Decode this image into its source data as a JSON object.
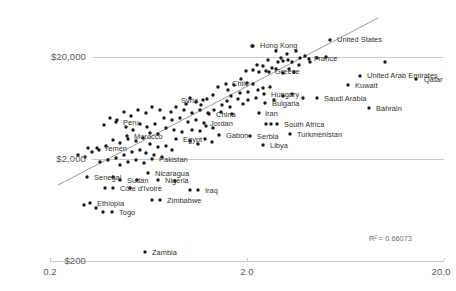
{
  "chart_data": {
    "type": "scatter",
    "title": "",
    "xlabel": "",
    "ylabel": "",
    "xscale": "log",
    "yscale": "log",
    "xlim": [
      0.2,
      20.0
    ],
    "ylim": [
      200,
      20000
    ],
    "x_ticks": [
      "0.2",
      "2.0",
      "20.0"
    ],
    "x_tick_values": [
      0.2,
      2.0,
      20.0
    ],
    "y_ticks": [
      "$200",
      "$2,000",
      "$20,000"
    ],
    "y_tick_values": [
      200,
      2000,
      20000
    ],
    "grid": true,
    "legend": null,
    "annotation": "R² = 0.66073",
    "annotation_r2": 0.66073,
    "trendline": {
      "x0": 0.28,
      "y0": 260,
      "x1": 13.5,
      "y1": 33000
    },
    "dot_color": "#1a1a1a",
    "line_color": "#9a9a9a",
    "axis_color": "#c9c9c9",
    "points": [
      {
        "label": "Hong Kong",
        "px": 253,
        "py": 46,
        "lx": 260,
        "ly": 42
      },
      {
        "label": "United States",
        "px": 330,
        "py": 40,
        "lx": 337,
        "ly": 36
      },
      {
        "label": "France",
        "px": 309,
        "py": 59,
        "lx": 314,
        "ly": 55
      },
      {
        "label": "Greece",
        "px": 269,
        "py": 72,
        "lx": 275,
        "ly": 68
      },
      {
        "label": "United Arab Emirates",
        "px": 360,
        "py": 76,
        "lx": 367,
        "ly": 72
      },
      {
        "label": "Qatar",
        "px": 416,
        "py": 79,
        "lx": 424,
        "ly": 76
      },
      {
        "label": "Kuwait",
        "px": 348,
        "py": 85,
        "lx": 355,
        "ly": 82
      },
      {
        "label": "Chile",
        "px": 226,
        "py": 84,
        "lx": 232,
        "ly": 80
      },
      {
        "label": "Hungary",
        "px": 264,
        "py": 94,
        "lx": 271,
        "ly": 91
      },
      {
        "label": "Saudi Arabia",
        "px": 317,
        "py": 98,
        "lx": 324,
        "ly": 95
      },
      {
        "label": "Bahrain",
        "px": 369,
        "py": 108,
        "lx": 376,
        "ly": 105
      },
      {
        "label": "Bulgaria",
        "px": 265,
        "py": 103,
        "lx": 272,
        "ly": 100
      },
      {
        "label": "Syria",
        "px": 203,
        "py": 100,
        "lx": 181,
        "ly": 97
      },
      {
        "label": "Iran",
        "px": 259,
        "py": 113,
        "lx": 265,
        "ly": 110
      },
      {
        "label": "China",
        "px": 209,
        "py": 114,
        "lx": 216,
        "ly": 111
      },
      {
        "label": "Jordan",
        "px": 204,
        "py": 123,
        "lx": 210,
        "ly": 120
      },
      {
        "label": "South Africa",
        "px": 277,
        "py": 124,
        "lx": 284,
        "ly": 121
      },
      {
        "label": "Turkmenistan",
        "px": 290,
        "py": 134,
        "lx": 297,
        "ly": 131
      },
      {
        "label": "Serbia",
        "px": 250,
        "py": 136,
        "lx": 257,
        "ly": 133
      },
      {
        "label": "Gabon",
        "px": 219,
        "py": 135,
        "lx": 226,
        "ly": 132
      },
      {
        "label": "Libya",
        "px": 263,
        "py": 145,
        "lx": 270,
        "ly": 142
      },
      {
        "label": "Peru",
        "px": 116,
        "py": 122,
        "lx": 123,
        "ly": 119
      },
      {
        "label": "Morocco",
        "px": 127,
        "py": 136,
        "lx": 134,
        "ly": 133
      },
      {
        "label": "Egypt",
        "px": 176,
        "py": 139,
        "lx": 183,
        "ly": 136
      },
      {
        "label": "Yemen",
        "px": 97,
        "py": 148,
        "lx": 104,
        "ly": 145
      },
      {
        "label": "Pakistan",
        "px": 152,
        "py": 159,
        "lx": 159,
        "ly": 156
      },
      {
        "label": "Nicaragua",
        "px": 148,
        "py": 173,
        "lx": 155,
        "ly": 170
      },
      {
        "label": "Senegal",
        "px": 87,
        "py": 177,
        "lx": 94,
        "ly": 174
      },
      {
        "label": "Sudan",
        "px": 120,
        "py": 180,
        "lx": 127,
        "ly": 177
      },
      {
        "label": "Nigeria",
        "px": 158,
        "py": 180,
        "lx": 165,
        "ly": 177
      },
      {
        "label": "Côte d'Ivoire",
        "px": 113,
        "py": 188,
        "lx": 120,
        "ly": 185
      },
      {
        "label": "Iraq",
        "px": 198,
        "py": 190,
        "lx": 205,
        "ly": 187
      },
      {
        "label": "Zimbabwe",
        "px": 160,
        "py": 200,
        "lx": 167,
        "ly": 197
      },
      {
        "label": "Ethiopia",
        "px": 90,
        "py": 203,
        "lx": 97,
        "ly": 200
      },
      {
        "label": "Togo",
        "px": 112,
        "py": 212,
        "lx": 119,
        "ly": 209
      },
      {
        "label": "Zambia",
        "px": 145,
        "py": 252,
        "lx": 152,
        "ly": 249
      }
    ],
    "unlabeled_points": [
      [
        252,
        46
      ],
      [
        276,
        51
      ],
      [
        287,
        54
      ],
      [
        296,
        51
      ],
      [
        300,
        58
      ],
      [
        305,
        56
      ],
      [
        288,
        60
      ],
      [
        292,
        62
      ],
      [
        283,
        61
      ],
      [
        278,
        62
      ],
      [
        281,
        58
      ],
      [
        268,
        60
      ],
      [
        299,
        65
      ],
      [
        310,
        62
      ],
      [
        317,
        58
      ],
      [
        326,
        57
      ],
      [
        263,
        66
      ],
      [
        257,
        65
      ],
      [
        272,
        68
      ],
      [
        276,
        69
      ],
      [
        266,
        71
      ],
      [
        259,
        72
      ],
      [
        253,
        70
      ],
      [
        246,
        71
      ],
      [
        289,
        69
      ],
      [
        294,
        72
      ],
      [
        283,
        73
      ],
      [
        385,
        62
      ],
      [
        241,
        79
      ],
      [
        247,
        83
      ],
      [
        234,
        85
      ],
      [
        253,
        84
      ],
      [
        263,
        88
      ],
      [
        270,
        87
      ],
      [
        258,
        90
      ],
      [
        248,
        92
      ],
      [
        240,
        93
      ],
      [
        228,
        90
      ],
      [
        218,
        87
      ],
      [
        231,
        96
      ],
      [
        238,
        99
      ],
      [
        227,
        101
      ],
      [
        248,
        100
      ],
      [
        256,
        98
      ],
      [
        274,
        100
      ],
      [
        283,
        96
      ],
      [
        292,
        94
      ],
      [
        303,
        98
      ],
      [
        213,
        95
      ],
      [
        207,
        99
      ],
      [
        196,
        102
      ],
      [
        201,
        105
      ],
      [
        190,
        98
      ],
      [
        186,
        104
      ],
      [
        222,
        105
      ],
      [
        230,
        107
      ],
      [
        243,
        104
      ],
      [
        200,
        110
      ],
      [
        208,
        113
      ],
      [
        214,
        110
      ],
      [
        221,
        112
      ],
      [
        232,
        114
      ],
      [
        192,
        113
      ],
      [
        184,
        110
      ],
      [
        176,
        107
      ],
      [
        171,
        112
      ],
      [
        160,
        110
      ],
      [
        152,
        107
      ],
      [
        146,
        113
      ],
      [
        138,
        110
      ],
      [
        131,
        116
      ],
      [
        124,
        112
      ],
      [
        117,
        120
      ],
      [
        110,
        118
      ],
      [
        104,
        125
      ],
      [
        164,
        118
      ],
      [
        172,
        120
      ],
      [
        180,
        118
      ],
      [
        188,
        122
      ],
      [
        196,
        120
      ],
      [
        206,
        126
      ],
      [
        213,
        128
      ],
      [
        200,
        131
      ],
      [
        192,
        130
      ],
      [
        155,
        124
      ],
      [
        147,
        127
      ],
      [
        140,
        124
      ],
      [
        133,
        130
      ],
      [
        126,
        127
      ],
      [
        166,
        128
      ],
      [
        174,
        130
      ],
      [
        182,
        132
      ],
      [
        158,
        134
      ],
      [
        150,
        133
      ],
      [
        205,
        139
      ],
      [
        212,
        142
      ],
      [
        198,
        144
      ],
      [
        190,
        141
      ],
      [
        143,
        138
      ],
      [
        136,
        141
      ],
      [
        128,
        139
      ],
      [
        120,
        143
      ],
      [
        113,
        140
      ],
      [
        106,
        146
      ],
      [
        99,
        150
      ],
      [
        92,
        152
      ],
      [
        150,
        144
      ],
      [
        158,
        147
      ],
      [
        166,
        146
      ],
      [
        172,
        150
      ],
      [
        140,
        150
      ],
      [
        132,
        152
      ],
      [
        124,
        155
      ],
      [
        116,
        158
      ],
      [
        108,
        160
      ],
      [
        100,
        162
      ],
      [
        146,
        153
      ],
      [
        154,
        155
      ],
      [
        162,
        157
      ],
      [
        136,
        160
      ],
      [
        128,
        162
      ],
      [
        120,
        165
      ],
      [
        144,
        163
      ],
      [
        113,
        177
      ],
      [
        137,
        180
      ],
      [
        175,
        181
      ],
      [
        105,
        188
      ],
      [
        130,
        188
      ],
      [
        190,
        190
      ],
      [
        152,
        200
      ],
      [
        84,
        205
      ],
      [
        103,
        212
      ],
      [
        96,
        208
      ],
      [
        271,
        124
      ],
      [
        266,
        124
      ],
      [
        88,
        148
      ],
      [
        78,
        155
      ],
      [
        85,
        157
      ]
    ]
  }
}
